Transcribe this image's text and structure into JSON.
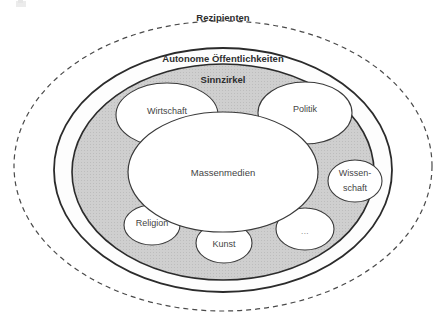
{
  "diagram": {
    "bands": [
      {
        "id": "rezipienten",
        "label": "Rezipienten",
        "border_style": "dashed",
        "fill": "#ffffff"
      },
      {
        "id": "autonome-oeffentlichkeiten",
        "label": "Autonome Öffentlichkeiten",
        "border_style": "solid",
        "fill": "#fdfdfd"
      },
      {
        "id": "sinnzirkel",
        "label": "Sinnzirkel",
        "border_style": "solid",
        "fill": "#cfcfcf"
      }
    ],
    "center": {
      "id": "massenmedien",
      "label": "Massenmedien",
      "fill": "#ffffff"
    },
    "nodes": [
      {
        "id": "wirtschaft",
        "label": "Wirtschaft",
        "lines": [
          "Wirtschaft"
        ]
      },
      {
        "id": "politik",
        "label": "Politik",
        "lines": [
          "Politik"
        ]
      },
      {
        "id": "wissenschaft",
        "label": "Wissenschaft",
        "lines": [
          "Wissen-",
          "schaft"
        ]
      },
      {
        "id": "weitere",
        "label": "...",
        "lines": [
          "..."
        ]
      },
      {
        "id": "kunst",
        "label": "Kunst",
        "lines": [
          "Kunst"
        ]
      },
      {
        "id": "religion",
        "label": "Religion",
        "lines": [
          "Religion"
        ]
      }
    ],
    "colors": {
      "stroke": "#2b2b2b",
      "band_gray": "#cfcfcf",
      "band_white": "#ffffff",
      "text": "#3b3b3b",
      "dashed_stroke": "#555555"
    }
  }
}
